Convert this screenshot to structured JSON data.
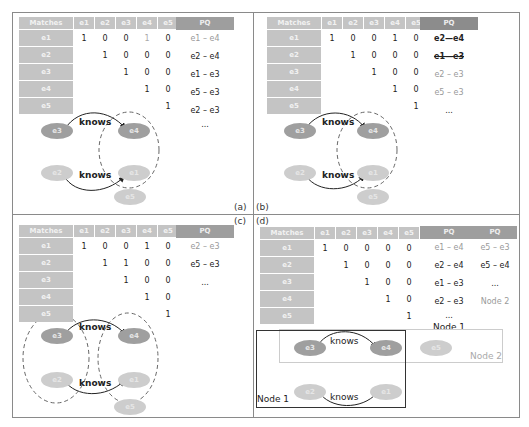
{
  "panels": {
    "a": {
      "tag": "(a)",
      "matrix": {
        "header": [
          "Matches",
          "e1",
          "e2",
          "e3",
          "e4",
          "e5"
        ],
        "rows": [
          {
            "label": "e1",
            "values": [
              "1",
              "0",
              "0",
              "1",
              "0"
            ]
          },
          {
            "label": "e2",
            "values": [
              "",
              "1",
              "0",
              "0",
              "0"
            ]
          },
          {
            "label": "e3",
            "values": [
              "",
              "",
              "1",
              "0",
              "0"
            ]
          },
          {
            "label": "e4",
            "values": [
              "",
              "",
              "",
              "1",
              "0"
            ]
          },
          {
            "label": "e5",
            "values": [
              "",
              "",
              "",
              "",
              "1"
            ]
          }
        ]
      },
      "pq": {
        "header": "PQ",
        "items": [
          "e1 – e4",
          "e2 – e4",
          "e1 – e3",
          "e5 – e3",
          "e2 – e3",
          "..."
        ]
      },
      "graph": {
        "nodes": [
          "e3",
          "e4",
          "e2",
          "e1",
          "e5"
        ],
        "edges": [
          "knows",
          "knows"
        ]
      }
    },
    "b": {
      "tag": "(b)",
      "matrix": {
        "header": [
          "Matches",
          "e1",
          "e2",
          "e3",
          "e4",
          "e5"
        ],
        "rows": [
          {
            "label": "e1",
            "values": [
              "1",
              "0",
              "0",
              "1",
              "0"
            ]
          },
          {
            "label": "e2",
            "values": [
              "",
              "1",
              "0",
              "0",
              "0"
            ]
          },
          {
            "label": "e3",
            "values": [
              "",
              "",
              "1",
              "0",
              "0"
            ]
          },
          {
            "label": "e4",
            "values": [
              "",
              "",
              "",
              "1",
              "0"
            ]
          },
          {
            "label": "e5",
            "values": [
              "",
              "",
              "",
              "",
              "1"
            ]
          }
        ]
      },
      "pq": {
        "header": "PQ",
        "items": [
          "e2—e4",
          "e1—e3",
          "e2 – e3",
          "e5 – e3",
          "..."
        ]
      },
      "graph": {
        "nodes": [
          "e3",
          "e4",
          "e2",
          "e1",
          "e5"
        ],
        "edges": [
          "knows",
          "knows"
        ]
      }
    },
    "c": {
      "tag": "(c)",
      "matrix": {
        "header": [
          "Matches",
          "e1",
          "e2",
          "e3",
          "e4",
          "e5"
        ],
        "rows": [
          {
            "label": "e1",
            "values": [
              "1",
              "0",
              "0",
              "1",
              "0"
            ]
          },
          {
            "label": "e2",
            "values": [
              "",
              "1",
              "1",
              "0",
              "0"
            ]
          },
          {
            "label": "e3",
            "values": [
              "",
              "",
              "1",
              "0",
              "0"
            ]
          },
          {
            "label": "e4",
            "values": [
              "",
              "",
              "",
              "1",
              "0"
            ]
          },
          {
            "label": "e5",
            "values": [
              "",
              "",
              "",
              "",
              "1"
            ]
          }
        ]
      },
      "pq": {
        "header": "PQ",
        "items": [
          "e2 – e3",
          "e5 – e3",
          "..."
        ]
      },
      "graph": {
        "nodes": [
          "e3",
          "e4",
          "e2",
          "e1",
          "e5"
        ],
        "edges": [
          "knows",
          "knows"
        ]
      }
    },
    "d": {
      "tag": "(d)",
      "matrix": {
        "header": [
          "Matches",
          "e1",
          "e2",
          "e3",
          "e4",
          "e5"
        ],
        "rows": [
          {
            "label": "e1",
            "values": [
              "1",
              "0",
              "0",
              "0",
              "0"
            ]
          },
          {
            "label": "e2",
            "values": [
              "",
              "1",
              "0",
              "0",
              "0"
            ]
          },
          {
            "label": "e3",
            "values": [
              "",
              "",
              "1",
              "0",
              "0"
            ]
          },
          {
            "label": "e4",
            "values": [
              "",
              "",
              "",
              "1",
              "0"
            ]
          },
          {
            "label": "e5",
            "values": [
              "",
              "",
              "",
              "",
              "1"
            ]
          }
        ]
      },
      "pq1": {
        "header": "PQ",
        "items": [
          "e1 – e4",
          "e2 – e4",
          "e1 – e3",
          "e2 – e3",
          "..."
        ],
        "caption": "Node 1"
      },
      "pq2": {
        "header": "PQ",
        "items": [
          "e5 – e3",
          "e5 – e4",
          "..."
        ],
        "caption": "Node 2"
      },
      "graph": {
        "nodes": [
          "e3",
          "e4",
          "e5",
          "e2",
          "e1"
        ],
        "edges": [
          "knows",
          "knows"
        ],
        "node1_label": "Node 1",
        "node2_label": "Node 2"
      }
    }
  }
}
